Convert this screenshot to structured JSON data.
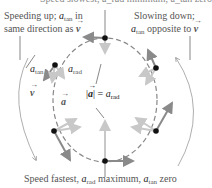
{
  "diagram": {
    "top_caption": "Speed slowest, a_rad minimum, a_tan zero",
    "left_caption": {
      "line1_prefix": "Speeding up; ",
      "line1_sym": "a",
      "line1_sub": "tan",
      "line1_suffix": " in",
      "line2_prefix": "same direction as ",
      "line2_vec": "v"
    },
    "right_caption": {
      "line1": "Slowing down;",
      "line2_sym": "a",
      "line2_sub": "tan",
      "line2_suffix": " opposite to ",
      "line2_vec": "v"
    },
    "bottom_caption": {
      "prefix": "Speed fastest, ",
      "sym1": "a",
      "sub1": "rad",
      "mid": " maximum, ",
      "sym2": "a",
      "sub2": "tan",
      "suffix": " zero"
    },
    "labels": {
      "a_tan_sym": "a",
      "a_tan_sub": "tan",
      "a_rad_sym": "a",
      "a_rad_sub": "rad",
      "v_vec": "v",
      "a_vec": "a",
      "magnitude_left": "|",
      "magnitude_vec": "a",
      "magnitude_right": "| = ",
      "magnitude_sym": "a",
      "magnitude_sub": "rad"
    },
    "colors": {
      "path_dash": "#888888",
      "velocity_arrow": "#8a8a8a",
      "accel_arrow": "#c8c8c8",
      "dot": "#111111",
      "guide_line": "#555555"
    }
  }
}
